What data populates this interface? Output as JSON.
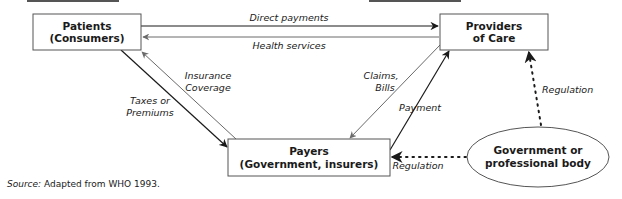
{
  "nodes": {
    "patients": {
      "line1": "Patients",
      "line2": "(Consumers)"
    },
    "providers": {
      "line1": "Providers",
      "line2": "of Care"
    },
    "payers": {
      "line1": "Payers",
      "line2": "(Government, insurers)"
    },
    "government": {
      "line1": "Government or",
      "line2": "professional body"
    }
  },
  "edges": {
    "direct_payments": "Direct payments",
    "health_services": "Health services",
    "insurance_coverage": {
      "line1": "Insurance",
      "line2": "Coverage"
    },
    "taxes_premiums": {
      "line1": "Taxes or",
      "line2": "Premiums"
    },
    "claims_bills": {
      "line1": "Claims,",
      "line2": "Bills"
    },
    "payment": "Payment",
    "regulation_providers": "Regulation",
    "regulation_payers": "Regulation"
  },
  "source": {
    "label": "Source:",
    "text": " Adapted from WHO 1993."
  },
  "colors": {
    "dark_line": "#1a1a1a",
    "gray_line": "#7a7a7a",
    "box_border": "#555555"
  }
}
